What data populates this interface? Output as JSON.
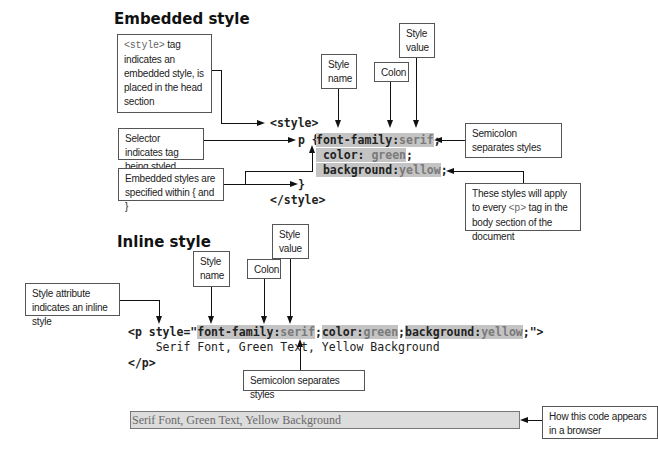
{
  "embedded": {
    "heading": "Embedded style",
    "callouts": {
      "style_tag_code": "<style>",
      "style_tag_text": " tag indicates an embedded style, is placed in the head section",
      "selector": "Selector indicates tag being styled",
      "braces": "Embedded styles are specified within { and }",
      "style_name": "Style name",
      "colon": "Colon",
      "style_value": "Style value",
      "semicolon": "Semicolon separates styles",
      "apply_pre": "These styles will apply to every ",
      "apply_code": "<p>",
      "apply_post": " tag in the body section of the document"
    },
    "code": {
      "open_tag": "<style>",
      "selector": "p {",
      "line1_name": "font-family:",
      "line1_value": "serif",
      "line1_end": ";",
      "line2_name": "color: ",
      "line2_value": "green",
      "line2_end": ";",
      "line3_name": "background:",
      "line3_value": "yellow",
      "line3_end": ";",
      "close_brace": "}",
      "close_tag": "</style>"
    }
  },
  "inline": {
    "heading": "Inline style",
    "callouts": {
      "attribute": "Style attribute indicates an inline style",
      "style_name": "Style name",
      "colon": "Colon",
      "style_value": "Style value",
      "semicolon": "Semicolon separates styles"
    },
    "code": {
      "open": "<p style=\"",
      "n1": "font-family:",
      "v1": "serif",
      "s1": ";",
      "n2": "color:",
      "v2": "green",
      "s2": ";",
      "n3": "background:",
      "v3": "yellow",
      "s3": ";",
      "close_attr": "\">",
      "content": "    Serif Font, Green Text, Yellow Background",
      "close_tag": "</p>"
    }
  },
  "browser": {
    "rendered_text": "Serif Font, Green Text, Yellow Background",
    "callout": "How this code appears in a browser"
  },
  "colors": {
    "highlight": "#c4c4c4",
    "value_text": "#7a7a7a",
    "browser_bg": "#dcdcdc"
  }
}
